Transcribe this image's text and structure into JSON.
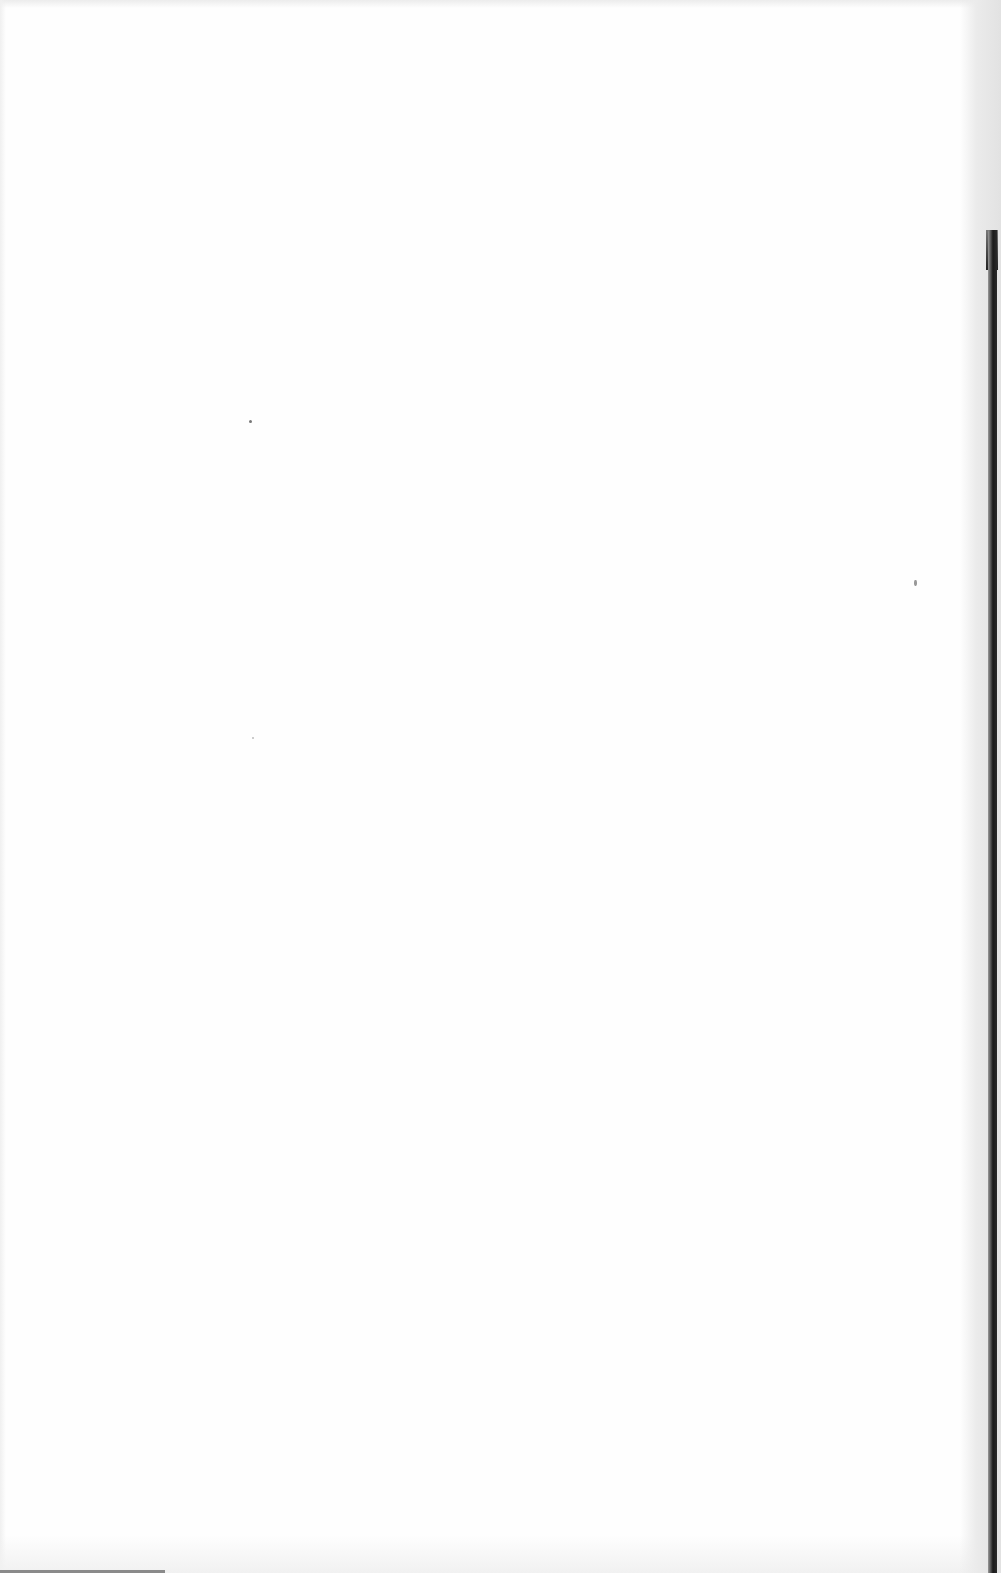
{
  "document": {
    "type": "scanned-page",
    "state": "blank",
    "text": ""
  },
  "colors": {
    "paper": "#fefefe",
    "binding": "#1a1a1a",
    "margin_shade": "#e2e2e2"
  }
}
